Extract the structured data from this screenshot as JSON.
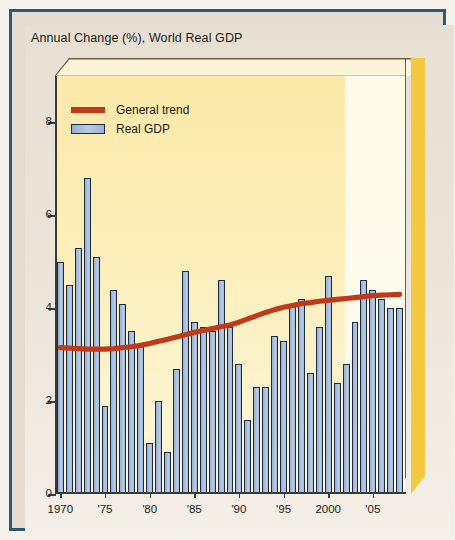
{
  "chart_title": "Annual Change (%), World Real GDP",
  "legend": {
    "items": [
      {
        "label": "General trend",
        "type": "line",
        "color": "#c0391b"
      },
      {
        "label": "Real GDP",
        "type": "bar",
        "color": "#a9c0dc"
      }
    ]
  },
  "axes": {
    "y_ticks": [
      "0",
      "2",
      "4",
      "6",
      "8"
    ],
    "y_tick_values": [
      0,
      2,
      4,
      6,
      8
    ],
    "ylim": [
      0,
      9
    ],
    "x_tick_labels": [
      "1970",
      "'75",
      "'80",
      "'85",
      "'90",
      "'95",
      "2000",
      "'05"
    ],
    "x_tick_years": [
      1970,
      1975,
      1980,
      1985,
      1990,
      1995,
      2000,
      2005
    ],
    "xlim": [
      1969.4,
      2008.6
    ]
  },
  "colors": {
    "bar_fill": "#a9c0dc",
    "bar_stroke": "#1b2b44",
    "trend_line": "#c0391b",
    "plot_background": "#fbeeb8",
    "forecast_band": "#fdfae8",
    "bevel_gold": "#f2c93f",
    "bevel_cream": "#fbf4d9",
    "frame_border": "#2b5a72",
    "paper": "#e8dfd3"
  },
  "chart_data": {
    "type": "bar",
    "title": "Annual Change (%), World Real GDP",
    "xlabel": "",
    "ylabel": "Annual Change (%)",
    "ylim": [
      0,
      9
    ],
    "grid": false,
    "legend_position": "top-left",
    "categories": [
      "1970",
      "1971",
      "1972",
      "1973",
      "1974",
      "1975",
      "1976",
      "1977",
      "1978",
      "1979",
      "1980",
      "1981",
      "1982",
      "1983",
      "1984",
      "1985",
      "1986",
      "1987",
      "1988",
      "1989",
      "1990",
      "1991",
      "1992",
      "1993",
      "1994",
      "1995",
      "1996",
      "1997",
      "1998",
      "1999",
      "2000",
      "2001",
      "2002",
      "2003",
      "2004",
      "2005",
      "2006",
      "2007",
      "2008"
    ],
    "series": [
      {
        "name": "Real GDP",
        "type": "bar",
        "values": [
          5.0,
          4.5,
          5.3,
          6.8,
          5.1,
          1.9,
          4.4,
          4.1,
          3.5,
          3.2,
          1.1,
          2.0,
          0.9,
          2.7,
          4.8,
          3.7,
          3.6,
          3.5,
          4.6,
          3.6,
          2.8,
          1.6,
          2.3,
          2.3,
          3.4,
          3.3,
          4.1,
          4.2,
          2.6,
          3.6,
          4.7,
          2.4,
          2.8,
          3.7,
          4.6,
          4.4,
          4.2,
          4.0,
          4.0
        ]
      },
      {
        "name": "General trend",
        "type": "line",
        "values": [
          3.15,
          3.14,
          3.13,
          3.12,
          3.12,
          3.12,
          3.13,
          3.15,
          3.17,
          3.2,
          3.24,
          3.29,
          3.33,
          3.38,
          3.43,
          3.48,
          3.52,
          3.56,
          3.6,
          3.64,
          3.7,
          3.77,
          3.84,
          3.91,
          3.97,
          4.02,
          4.06,
          4.1,
          4.12,
          4.15,
          4.17,
          4.19,
          4.21,
          4.23,
          4.25,
          4.27,
          4.28,
          4.29,
          4.3
        ]
      }
    ]
  }
}
